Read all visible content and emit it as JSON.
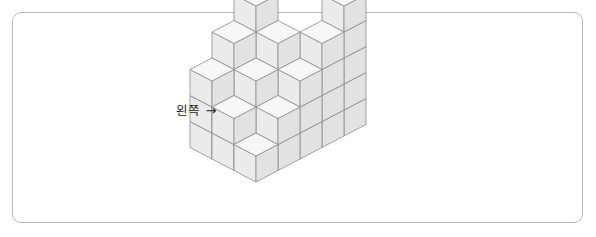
{
  "page": {
    "width": 596,
    "height": 237,
    "background_color": "#ffffff",
    "frame": {
      "border_color": "#b9bcbe",
      "corner_radius": 9,
      "x": 12,
      "y": 12,
      "width": 571,
      "height": 211
    }
  },
  "annotation": {
    "label_text": "왼쪽",
    "arrow_glyph": "→",
    "label_meaning": "left",
    "x": 176,
    "y": 104,
    "color": "#1d1d1d"
  },
  "figure": {
    "type": "isometric-cube-stack",
    "colors": {
      "top_face": "#f7f7f7",
      "left_face": "#ebebeb",
      "right_face": "#e2e2e2",
      "edge_stroke": "#8c8f91",
      "edge_width": 0.8
    },
    "projection": {
      "cube_half_width": 22,
      "cube_rise": 11.5,
      "cube_height": 26,
      "origin_x": 256,
      "origin_y": 182
    },
    "grid": {
      "rows": 3,
      "cols": 5,
      "row_label": "depth (toward upper-left)",
      "col_label": "width (toward upper-right)",
      "heights": [
        [
          1,
          2,
          3,
          4,
          5
        ],
        [
          2,
          3,
          4,
          0,
          0
        ],
        [
          3,
          4,
          5,
          0,
          0
        ]
      ],
      "heights_note": "heights[row][col] = number of stacked unit cubes; 0 = empty column",
      "total_cubes": 41
    }
  }
}
